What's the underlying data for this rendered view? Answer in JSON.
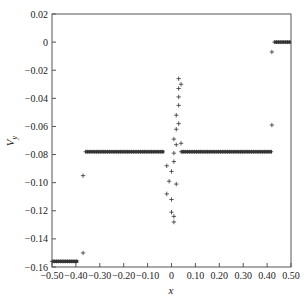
{
  "chart_data": {
    "type": "scatter",
    "title": "",
    "xlabel": "x",
    "ylabel": "V_y",
    "ylabel_main": "V",
    "ylabel_sub": "y",
    "xlim": [
      -0.5,
      0.5
    ],
    "ylim": [
      -0.16,
      0.02
    ],
    "grid": false,
    "legend": "none",
    "marker": "+",
    "marker_color": "#333333",
    "x_ticks": [
      -0.5,
      -0.4,
      -0.3,
      -0.2,
      -0.1,
      0,
      0.1,
      0.2,
      0.3,
      0.4,
      0.5
    ],
    "x_tick_labels": [
      "-0.50",
      "-0.40",
      "-0.30",
      "-0.20",
      "-0.10",
      "0",
      "0.10",
      "0.20",
      "0.30",
      "0.40",
      "0.50"
    ],
    "y_ticks": [
      0.02,
      0,
      -0.02,
      -0.04,
      -0.06,
      -0.08,
      -0.1,
      -0.12,
      -0.14,
      -0.16
    ],
    "y_tick_labels": [
      "0.02",
      "0",
      "-0.02",
      "-0.04",
      "-0.06",
      "-0.08",
      "-0.10",
      "-0.12",
      "-0.14",
      "-0.16"
    ],
    "series": [
      {
        "name": "V_y",
        "segments": [
          {
            "x_start": -0.5,
            "x_end": -0.39,
            "y": -0.156,
            "note": "dense band of + markers"
          },
          {
            "x_start": -0.36,
            "x_end": -0.03,
            "y": -0.078,
            "note": "dense band of + markers"
          },
          {
            "x_start": 0.04,
            "x_end": 0.42,
            "y": -0.078,
            "note": "dense band of + markers"
          },
          {
            "x_start": 0.43,
            "x_end": 0.5,
            "y": 0.0,
            "note": "dense band of + markers"
          }
        ],
        "points": [
          {
            "x": -0.37,
            "y": -0.095
          },
          {
            "x": -0.37,
            "y": -0.15
          },
          {
            "x": -0.02,
            "y": -0.088
          },
          {
            "x": -0.01,
            "y": -0.099
          },
          {
            "x": -0.02,
            "y": -0.108
          },
          {
            "x": 0.0,
            "y": -0.112
          },
          {
            "x": 0.0,
            "y": -0.121
          },
          {
            "x": 0.01,
            "y": -0.124
          },
          {
            "x": 0.01,
            "y": -0.128
          },
          {
            "x": 0.0,
            "y": -0.092
          },
          {
            "x": 0.01,
            "y": -0.085
          },
          {
            "x": 0.02,
            "y": -0.101
          },
          {
            "x": 0.01,
            "y": -0.079
          },
          {
            "x": 0.02,
            "y": -0.073
          },
          {
            "x": 0.01,
            "y": -0.069
          },
          {
            "x": 0.02,
            "y": -0.062
          },
          {
            "x": 0.03,
            "y": -0.058
          },
          {
            "x": 0.02,
            "y": -0.052
          },
          {
            "x": 0.03,
            "y": -0.045
          },
          {
            "x": 0.03,
            "y": -0.039
          },
          {
            "x": 0.03,
            "y": -0.033
          },
          {
            "x": 0.04,
            "y": -0.03
          },
          {
            "x": 0.03,
            "y": -0.026
          },
          {
            "x": 0.04,
            "y": -0.072
          },
          {
            "x": 0.42,
            "y": -0.007
          },
          {
            "x": 0.42,
            "y": -0.059
          }
        ]
      }
    ]
  }
}
